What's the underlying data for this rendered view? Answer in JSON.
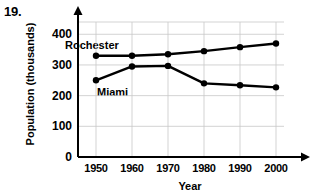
{
  "problem": {
    "number": "19."
  },
  "chart_data": {
    "type": "line",
    "title": "",
    "xlabel": "Year",
    "ylabel": "Population (thousands)",
    "x": [
      1950,
      1960,
      1970,
      1980,
      1990,
      2000
    ],
    "categories": [
      "1950",
      "1960",
      "1970",
      "1980",
      "1990",
      "2000"
    ],
    "xlim": [
      1945,
      2005
    ],
    "ylim": [
      0,
      440
    ],
    "yticks": [
      0,
      100,
      200,
      300,
      400
    ],
    "ytick_labels": [
      "0",
      "100",
      "200",
      "300",
      "400"
    ],
    "grid": true,
    "legend": "inline-labels",
    "series": [
      {
        "name": "Rochester",
        "values": [
          330,
          330,
          335,
          345,
          358,
          370
        ],
        "color": "#000000",
        "label_position": "above-left"
      },
      {
        "name": "Miami",
        "values": [
          250,
          295,
          297,
          240,
          234,
          227
        ],
        "color": "#000000",
        "label_position": "below-left"
      }
    ]
  }
}
